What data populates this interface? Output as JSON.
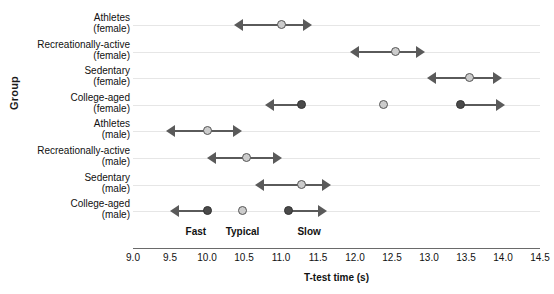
{
  "chart_data": {
    "type": "scatter",
    "title": "",
    "xlabel": "T-test time (s)",
    "ylabel": "Group",
    "xlim": [
      9.0,
      14.5
    ],
    "xticks": [
      "9.0",
      "9.5",
      "10.0",
      "10.5",
      "11.0",
      "11.5",
      "12.0",
      "12.5",
      "13.0",
      "13.5",
      "14.0",
      "14.5"
    ],
    "xtick_values": [
      9.0,
      9.5,
      10.0,
      10.5,
      11.0,
      11.5,
      12.0,
      12.5,
      13.0,
      13.5,
      14.0,
      14.5
    ],
    "grid": "horizontal-rowlines",
    "legend": "none",
    "zone_annotations": [
      {
        "label": "Fast",
        "x": 9.85
      },
      {
        "label": "Typical",
        "x": 10.48
      },
      {
        "label": "Slow",
        "x": 11.38
      }
    ],
    "categories": [
      {
        "line1": "Athletes",
        "line2": "(female)"
      },
      {
        "line1": "Recreationally-active",
        "line2": "(female)"
      },
      {
        "line1": "Sedentary",
        "line2": "(female)"
      },
      {
        "line1": "College-aged",
        "line2": "(female)"
      },
      {
        "line1": "Athletes",
        "line2": "(male)"
      },
      {
        "line1": "Recreationally-active",
        "line2": "(male)"
      },
      {
        "line1": "Sedentary",
        "line2": "(male)"
      },
      {
        "line1": "College-aged",
        "line2": "(male)"
      }
    ],
    "rows": [
      {
        "group": "Athletes (female)",
        "points": [
          {
            "x": 11.0,
            "shade": "light"
          }
        ],
        "segments": [
          {
            "from": 10.37,
            "to": 11.42,
            "arrow_left": true,
            "arrow_right": true
          }
        ]
      },
      {
        "group": "Recreationally-active (female)",
        "points": [
          {
            "x": 12.55,
            "shade": "light"
          }
        ],
        "segments": [
          {
            "from": 11.93,
            "to": 12.95,
            "arrow_left": true,
            "arrow_right": true
          }
        ]
      },
      {
        "group": "Sedentary (female)",
        "points": [
          {
            "x": 13.55,
            "shade": "light"
          }
        ],
        "segments": [
          {
            "from": 12.97,
            "to": 13.98,
            "arrow_left": true,
            "arrow_right": true
          }
        ]
      },
      {
        "group": "College-aged (female)",
        "points": [
          {
            "x": 11.28,
            "shade": "dark"
          },
          {
            "x": 12.38,
            "shade": "light"
          },
          {
            "x": 13.43,
            "shade": "dark"
          }
        ],
        "segments": [
          {
            "from": 10.78,
            "to": 11.28,
            "arrow_left": true,
            "arrow_right": false
          },
          {
            "from": 13.43,
            "to": 14.03,
            "arrow_left": false,
            "arrow_right": true
          }
        ]
      },
      {
        "group": "Athletes (male)",
        "points": [
          {
            "x": 10.0,
            "shade": "light"
          }
        ],
        "segments": [
          {
            "from": 9.45,
            "to": 10.47,
            "arrow_left": true,
            "arrow_right": true
          }
        ]
      },
      {
        "group": "Recreationally-active (male)",
        "points": [
          {
            "x": 10.53,
            "shade": "light"
          }
        ],
        "segments": [
          {
            "from": 10.0,
            "to": 11.02,
            "arrow_left": true,
            "arrow_right": true
          }
        ]
      },
      {
        "group": "Sedentary (male)",
        "points": [
          {
            "x": 11.28,
            "shade": "light"
          }
        ],
        "segments": [
          {
            "from": 10.65,
            "to": 11.68,
            "arrow_left": true,
            "arrow_right": true
          }
        ]
      },
      {
        "group": "College-aged (male)",
        "points": [
          {
            "x": 10.0,
            "shade": "dark"
          },
          {
            "x": 10.48,
            "shade": "light"
          },
          {
            "x": 11.1,
            "shade": "dark"
          }
        ],
        "segments": [
          {
            "from": 9.5,
            "to": 10.0,
            "arrow_left": true,
            "arrow_right": false
          },
          {
            "from": 11.1,
            "to": 11.62,
            "arrow_left": false,
            "arrow_right": true
          }
        ]
      }
    ],
    "colors": {
      "light_marker": "#cccccc",
      "dark_marker": "#4a4a4a",
      "line": "#5a5a5a",
      "rowline": "#e6e6e6",
      "axis": "#6a6a6a",
      "text": "#111111"
    }
  }
}
